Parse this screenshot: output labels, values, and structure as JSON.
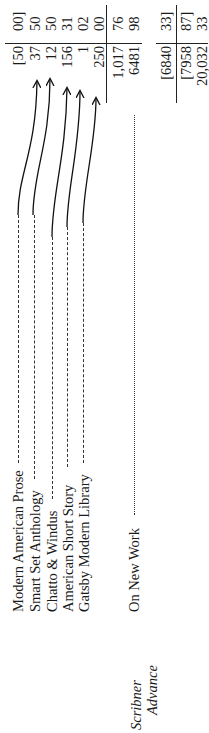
{
  "page": {
    "orientation": "rotated 90 degrees counter-clockwise",
    "side_labels": {
      "scribner": "Scribner",
      "advance": "Advance"
    },
    "rows": [
      {
        "label": "Modern American Prose",
        "whole": "[50",
        "cents": "00]"
      },
      {
        "label": "Smart Set Anthology",
        "whole": "37",
        "cents": "50"
      },
      {
        "label": "Chatto & Windus",
        "whole": "12",
        "cents": "50"
      },
      {
        "label": "American Short Story",
        "whole": "156",
        "cents": "31"
      },
      {
        "label": "Gatsby Modern Library",
        "whole": "1",
        "cents": "02"
      },
      {
        "label": "",
        "whole": "250",
        "cents": "00"
      }
    ],
    "subtotal": {
      "whole": "1,017",
      "cents": "76"
    },
    "new_work": {
      "label": "On New Work",
      "whole": "6481",
      "cents": "98"
    },
    "advance_block": [
      {
        "whole": "[6840",
        "cents": "33]"
      },
      {
        "whole": "[7958",
        "cents": "87]"
      },
      {
        "whole": "20,032",
        "cents": "33"
      }
    ]
  }
}
